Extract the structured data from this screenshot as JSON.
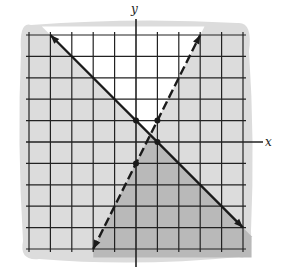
{
  "diagram": {
    "type": "system-of-linear-inequalities-graph",
    "axes": {
      "x_label": "x",
      "y_label": "y",
      "x_range": [
        -5,
        5
      ],
      "y_range": [
        -5,
        5
      ],
      "grid_step": 1
    },
    "lines": [
      {
        "name": "solid-line",
        "equation": "y = -x + 1",
        "style": "solid",
        "from": [
          -4,
          5
        ],
        "to": [
          5,
          -4
        ],
        "marked_points": [
          [
            0,
            1
          ],
          [
            1,
            0
          ]
        ]
      },
      {
        "name": "dashed-line",
        "equation": "y = 2x - 1",
        "style": "dashed",
        "from": [
          -2,
          -5
        ],
        "to": [
          3,
          5
        ],
        "marked_points": [
          [
            0,
            -1
          ],
          [
            1,
            1
          ]
        ]
      }
    ],
    "colors": {
      "light_shade": "#dcdcdc",
      "dark_shade": "#b9b9b9",
      "grid": "#222222",
      "line": "#1a1a1a"
    }
  }
}
